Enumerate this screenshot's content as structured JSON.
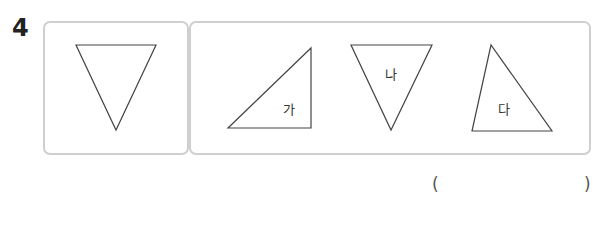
{
  "question": {
    "number": "4"
  },
  "reference_shape": {
    "type": "triangle",
    "description": "inverted acute triangle",
    "points": [
      [
        76,
        45
      ],
      [
        156,
        45
      ],
      [
        116,
        130
      ]
    ]
  },
  "options": [
    {
      "label": "가",
      "type": "triangle",
      "points": [
        [
          228,
          128
        ],
        [
          311,
          48
        ],
        [
          311,
          128
        ]
      ]
    },
    {
      "label": "나",
      "type": "triangle",
      "points": [
        [
          351,
          45
        ],
        [
          432,
          45
        ],
        [
          391,
          130
        ]
      ]
    },
    {
      "label": "다",
      "type": "triangle",
      "points": [
        [
          491,
          45
        ],
        [
          472,
          131
        ],
        [
          552,
          131
        ]
      ]
    }
  ],
  "answer": {
    "open_paren": "(",
    "close_paren": ")",
    "value": ""
  },
  "colors": {
    "border": "#cfcfcf",
    "stroke": "#444444",
    "text": "#222222"
  }
}
